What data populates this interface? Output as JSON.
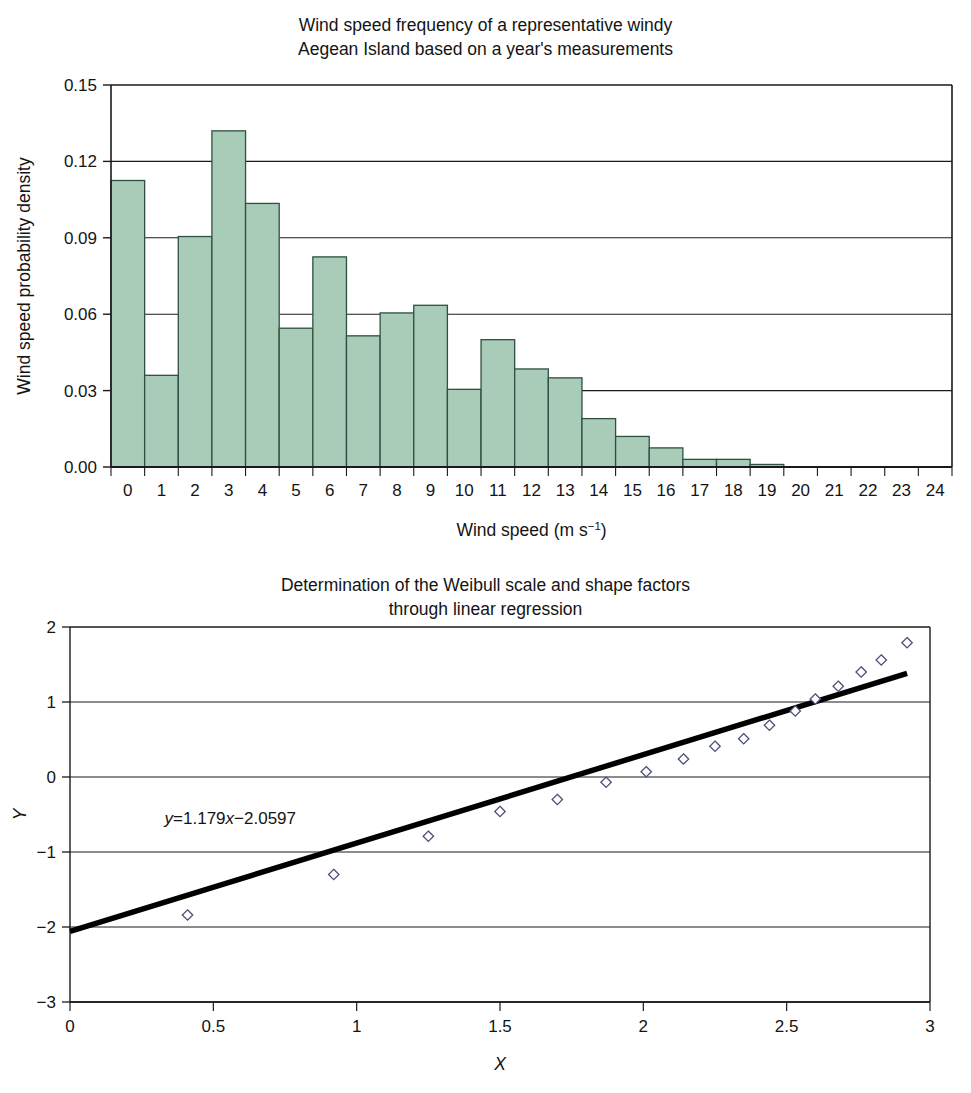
{
  "histogram": {
    "title": "Wind speed frequency of a representative windy\nAegean Island based on a year's measurements",
    "xlabel_main": "Wind speed (m s",
    "xlabel_sup": "−1",
    "xlabel_close": ")",
    "ylabel": "Wind speed probability density",
    "bar_fill": "#a8ccb8",
    "bar_stroke": "#2f4f42"
  },
  "regression": {
    "title": "Determination of the Weibull scale and shape factors\nthrough linear regression",
    "xlabel": "X",
    "ylabel": "Y",
    "equation_lhs": "y",
    "equation_eq": "=1.179",
    "equation_x": "x",
    "equation_rhs": "−2.0597",
    "marker_stroke": "#4a4f78",
    "line_color": "#000000"
  },
  "chart_data": [
    {
      "type": "bar",
      "title": "Wind speed frequency of a representative windy Aegean Island based on a year's measurements",
      "xlabel": "Wind speed (m s−1)",
      "ylabel": "Wind speed probability density",
      "categories": [
        "0",
        "1",
        "2",
        "3",
        "4",
        "5",
        "6",
        "7",
        "8",
        "9",
        "10",
        "11",
        "12",
        "13",
        "14",
        "15",
        "16",
        "17",
        "18",
        "19",
        "20",
        "21",
        "22",
        "23",
        "24"
      ],
      "values": [
        0.1125,
        0.036,
        0.0905,
        0.132,
        0.1035,
        0.0545,
        0.0825,
        0.0515,
        0.0605,
        0.0635,
        0.0305,
        0.05,
        0.0385,
        0.035,
        0.019,
        0.012,
        0.0075,
        0.003,
        0.003,
        0.001,
        0.0,
        0.0,
        0.0,
        0.0,
        0.0
      ],
      "xlim": [
        0,
        25
      ],
      "ylim": [
        0.0,
        0.15
      ],
      "yticks": [
        0.0,
        0.03,
        0.06,
        0.09,
        0.12,
        0.15
      ],
      "ytick_labels": [
        "0.00",
        "0.03",
        "0.06",
        "0.09",
        "0.12",
        "0.15"
      ],
      "grid": true,
      "legend": "none"
    },
    {
      "type": "scatter",
      "title": "Determination of the Weibull scale and shape factors through linear regression",
      "xlabel": "X",
      "ylabel": "Y",
      "xlim": [
        0,
        3
      ],
      "ylim": [
        -3,
        2
      ],
      "xticks": [
        0,
        0.5,
        1,
        1.5,
        2,
        2.5,
        3
      ],
      "xtick_labels": [
        "0",
        "0.5",
        "1",
        "1.5",
        "2",
        "2.5",
        "3"
      ],
      "yticks": [
        -3,
        -2,
        -1,
        0,
        1,
        2
      ],
      "ytick_labels": [
        "−3",
        "−2",
        "−1",
        "0",
        "1",
        "2"
      ],
      "grid": true,
      "legend": "none",
      "points": [
        {
          "x": 0.41,
          "y": -1.84
        },
        {
          "x": 0.92,
          "y": -1.3
        },
        {
          "x": 1.25,
          "y": -0.79
        },
        {
          "x": 1.5,
          "y": -0.46
        },
        {
          "x": 1.7,
          "y": -0.3
        },
        {
          "x": 1.87,
          "y": -0.07
        },
        {
          "x": 2.01,
          "y": 0.07
        },
        {
          "x": 2.14,
          "y": 0.24
        },
        {
          "x": 2.25,
          "y": 0.41
        },
        {
          "x": 2.35,
          "y": 0.51
        },
        {
          "x": 2.44,
          "y": 0.69
        },
        {
          "x": 2.53,
          "y": 0.88
        },
        {
          "x": 2.6,
          "y": 1.04
        },
        {
          "x": 2.68,
          "y": 1.21
        },
        {
          "x": 2.76,
          "y": 1.4
        },
        {
          "x": 2.83,
          "y": 1.56
        },
        {
          "x": 2.92,
          "y": 1.79
        }
      ],
      "fit_line": {
        "equation": "y = 1.179x − 2.0597",
        "slope": 1.179,
        "intercept": -2.0597,
        "x_start": 0.0,
        "x_end": 2.92
      },
      "annotations": [
        {
          "text": "y = 1.179x − 2.0597",
          "x": 0.33,
          "y": -0.62
        }
      ]
    }
  ]
}
